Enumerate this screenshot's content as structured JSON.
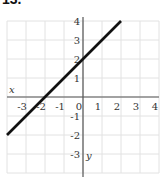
{
  "problem": {
    "label": "13."
  },
  "chart_data": {
    "type": "line",
    "title": "",
    "xlabel": "x",
    "ylabel": "y",
    "xlim": [
      -4,
      4
    ],
    "ylim": [
      -4,
      4
    ],
    "grid": true,
    "x_ticks": [
      "-3",
      "-2",
      "-1",
      "0",
      "1",
      "2",
      "3",
      "4"
    ],
    "y_ticks": [
      "4",
      "3",
      "2",
      "1",
      "-1",
      "-2",
      "-3"
    ],
    "series": [
      {
        "name": "line",
        "equation": "y = x + 2",
        "x": [
          -4,
          2
        ],
        "y": [
          -2,
          4
        ],
        "color": "#111111"
      }
    ]
  }
}
